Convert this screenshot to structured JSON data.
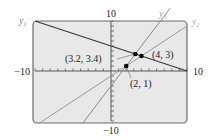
{
  "chart_data": {
    "type": "line",
    "title": "",
    "xlabel": "",
    "ylabel": "",
    "xlim": [
      -10,
      10
    ],
    "ylim": [
      -10,
      10
    ],
    "grid": false,
    "tick_spacing": 1,
    "axis_labels": {
      "x_min": "−10",
      "x_max": "10",
      "y_max": "10",
      "y_min": "−10"
    },
    "series": [
      {
        "name": "y1",
        "label": "y",
        "subscript": "1",
        "equation": "y = -0.5x + 5",
        "slope": -0.5,
        "intercept": 5,
        "color": "#3a3a3a",
        "width": 1.3
      },
      {
        "name": "y2",
        "label": "y",
        "subscript": "2",
        "equation": "y = x - 1",
        "slope": 1,
        "intercept": -1,
        "color": "#9a9a9a",
        "width": 1.0
      },
      {
        "name": "y3",
        "label": "y",
        "subscript": "3",
        "equation": "y = 2x - 3",
        "slope": 2,
        "intercept": -3,
        "color": "#8a8a8a",
        "width": 1.0
      }
    ],
    "points": [
      {
        "x": 3.2,
        "y": 3.4,
        "label": "(3.2, 3.4)",
        "lines": [
          "y1",
          "y3"
        ]
      },
      {
        "x": 4,
        "y": 3,
        "label": "(4, 3)",
        "lines": [
          "y1",
          "y2"
        ]
      },
      {
        "x": 2,
        "y": 1,
        "label": "(2, 1)",
        "lines": [
          "y2",
          "y3"
        ]
      }
    ],
    "colors": {
      "screen_bg": "#e8e8e8",
      "frame": "#6a6a6a",
      "axis": "#555555",
      "text": "#222222"
    }
  }
}
